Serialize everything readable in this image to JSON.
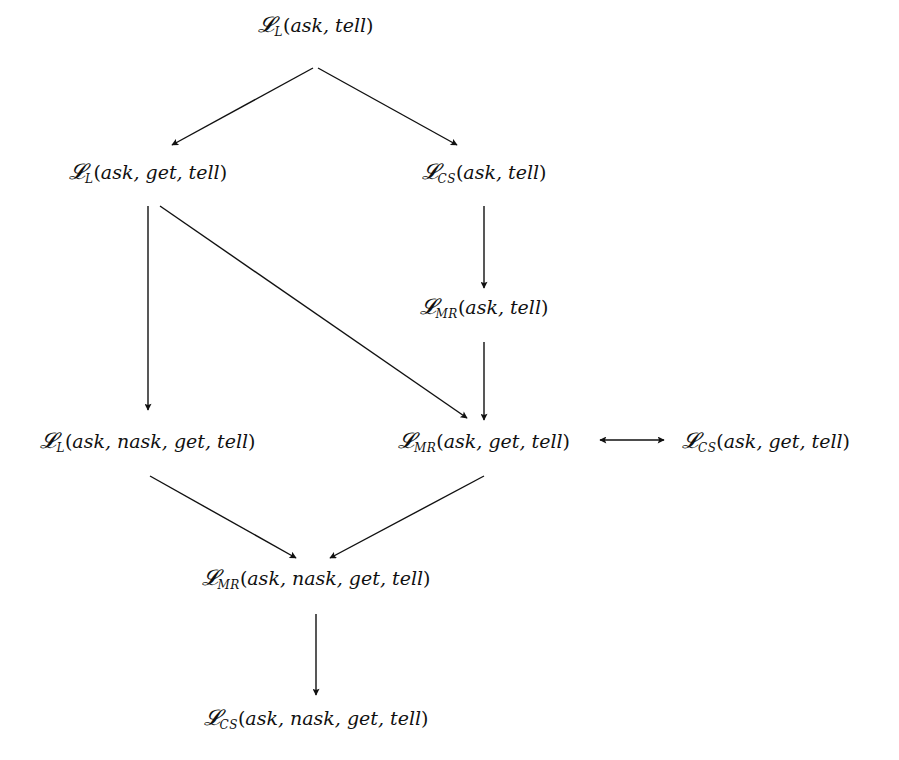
{
  "diagram": {
    "type": "hierarchy",
    "script_symbol": "𝓛",
    "nodes": [
      {
        "id": "n1",
        "sub": "L",
        "args": "ask, tell",
        "x": 316,
        "y": 25
      },
      {
        "id": "n2",
        "sub": "L",
        "args": "ask, get, tell",
        "x": 148,
        "y": 172
      },
      {
        "id": "n3",
        "sub": "CS",
        "args": "ask, tell",
        "x": 484,
        "y": 172
      },
      {
        "id": "n4",
        "sub": "MR",
        "args": "ask, tell",
        "x": 484,
        "y": 307
      },
      {
        "id": "n5",
        "sub": "L",
        "args": "ask, nask, get, tell",
        "x": 148,
        "y": 441
      },
      {
        "id": "n6",
        "sub": "MR",
        "args": "ask, get, tell",
        "x": 484,
        "y": 441
      },
      {
        "id": "n7",
        "sub": "CS",
        "args": "ask, get, tell",
        "x": 766,
        "y": 441
      },
      {
        "id": "n8",
        "sub": "MR",
        "args": "ask, nask, get, tell",
        "x": 316,
        "y": 578
      },
      {
        "id": "n9",
        "sub": "CS",
        "args": "ask, nask, get, tell",
        "x": 316,
        "y": 718
      }
    ],
    "edges": [
      {
        "from": "n1",
        "to": "n2",
        "x1": 313,
        "y1": 68,
        "x2": 172,
        "y2": 145,
        "type": "directed"
      },
      {
        "from": "n1",
        "to": "n3",
        "x1": 318,
        "y1": 68,
        "x2": 457,
        "y2": 145,
        "type": "directed"
      },
      {
        "from": "n2",
        "to": "n5",
        "x1": 148,
        "y1": 206,
        "x2": 148,
        "y2": 410,
        "type": "directed"
      },
      {
        "from": "n2",
        "to": "n6",
        "x1": 160,
        "y1": 206,
        "x2": 467,
        "y2": 418,
        "type": "directed"
      },
      {
        "from": "n3",
        "to": "n4",
        "x1": 484,
        "y1": 206,
        "x2": 484,
        "y2": 288,
        "type": "directed"
      },
      {
        "from": "n4",
        "to": "n6",
        "x1": 484,
        "y1": 342,
        "x2": 484,
        "y2": 420,
        "type": "directed"
      },
      {
        "from": "n6",
        "to": "n7",
        "x1": 600,
        "y1": 440,
        "x2": 664,
        "y2": 440,
        "type": "bidirectional"
      },
      {
        "from": "n5",
        "to": "n8",
        "x1": 150,
        "y1": 476,
        "x2": 296,
        "y2": 558,
        "type": "directed"
      },
      {
        "from": "n6",
        "to": "n8",
        "x1": 484,
        "y1": 476,
        "x2": 330,
        "y2": 558,
        "type": "directed"
      },
      {
        "from": "n8",
        "to": "n9",
        "x1": 316,
        "y1": 614,
        "x2": 316,
        "y2": 695,
        "type": "directed"
      }
    ],
    "stroke_color": "#111111"
  }
}
